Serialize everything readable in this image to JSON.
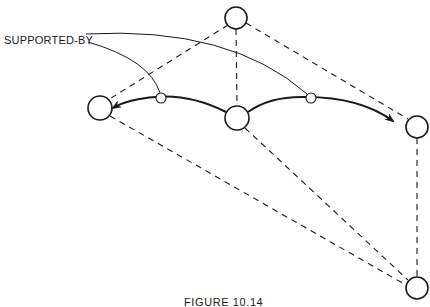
{
  "figure": {
    "label": "SUPPORTED-BY",
    "caption": "FIGURE 10.14",
    "colors": {
      "stroke": "#1a1a1a",
      "background": "#ffffff"
    },
    "nodes": [
      {
        "id": "top",
        "cx": 236,
        "cy": 18,
        "r": 11
      },
      {
        "id": "left",
        "cx": 100,
        "cy": 108,
        "r": 12
      },
      {
        "id": "middle",
        "cx": 237,
        "cy": 118,
        "r": 12
      },
      {
        "id": "right",
        "cx": 417,
        "cy": 127,
        "r": 11
      },
      {
        "id": "bottom-right",
        "cx": 417,
        "cy": 288,
        "r": 11
      }
    ],
    "junctions": [
      {
        "id": "junction-left",
        "cx": 161,
        "cy": 98,
        "r": 5
      },
      {
        "id": "junction-right",
        "cx": 311,
        "cy": 98,
        "r": 5
      }
    ],
    "dashed_edges": [
      [
        "top",
        "left"
      ],
      [
        "top",
        "middle"
      ],
      [
        "top",
        "right"
      ],
      [
        "left",
        "bottom-right"
      ],
      [
        "middle",
        "bottom-right"
      ],
      [
        "right",
        "bottom-right"
      ]
    ],
    "arrows": [
      {
        "from": "middle",
        "to": "left",
        "via": "junction-left"
      },
      {
        "from": "middle",
        "to": "right",
        "via": "junction-right"
      }
    ]
  }
}
